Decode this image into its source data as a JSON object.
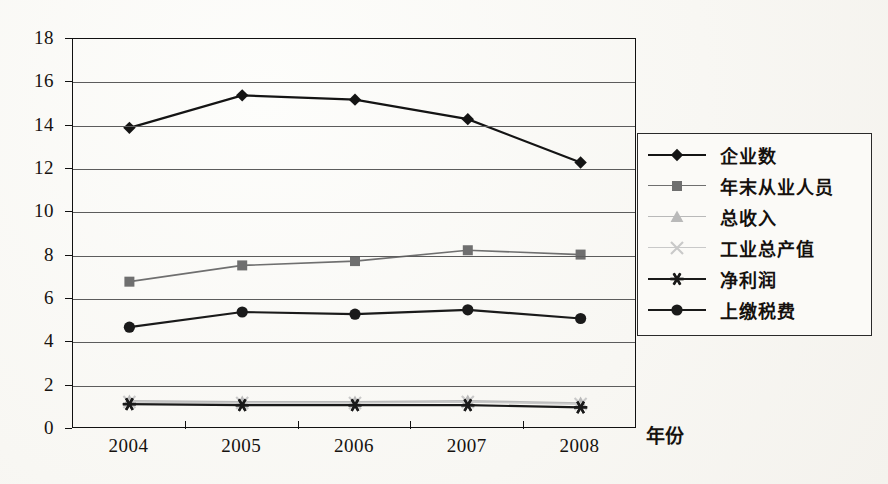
{
  "chart_data": {
    "type": "line",
    "title": "",
    "xlabel": "年份",
    "ylabel": "",
    "categories": [
      "2004",
      "2005",
      "2006",
      "2007",
      "2008"
    ],
    "ylim": [
      0,
      18
    ],
    "ytick_step": 2,
    "yticks": [
      "0",
      "2",
      "4",
      "6",
      "8",
      "10",
      "12",
      "14",
      "16",
      "18"
    ],
    "grid": true,
    "legend_position": "right",
    "series": [
      {
        "name": "企业数",
        "marker": "diamond",
        "color": "#141414",
        "values": [
          13.9,
          15.4,
          15.2,
          14.3,
          12.3
        ]
      },
      {
        "name": "年末从业人员",
        "marker": "square",
        "color": "#6f6f6f",
        "values": [
          6.8,
          7.55,
          7.75,
          8.25,
          8.05
        ]
      },
      {
        "name": "总收入",
        "marker": "triangle",
        "color": "#b9b9b9",
        "values": [
          1.3,
          1.25,
          1.25,
          1.3,
          1.2
        ]
      },
      {
        "name": "工业总产值",
        "marker": "cross",
        "color": "#c9c9c9",
        "values": [
          1.25,
          1.2,
          1.2,
          1.25,
          1.15
        ]
      },
      {
        "name": "净利润",
        "marker": "asterisk",
        "color": "#1a1a1a",
        "values": [
          1.15,
          1.1,
          1.1,
          1.1,
          1.0
        ]
      },
      {
        "name": "上缴税费",
        "marker": "circle",
        "color": "#1a1a1a",
        "values": [
          4.7,
          5.4,
          5.3,
          5.5,
          5.1
        ]
      }
    ]
  },
  "colors": {
    "axis": "#111111",
    "grid": "#5c5c5c",
    "text": "#16120f",
    "background": "#fbfaf7",
    "legend_border": "#2a2a2a"
  }
}
